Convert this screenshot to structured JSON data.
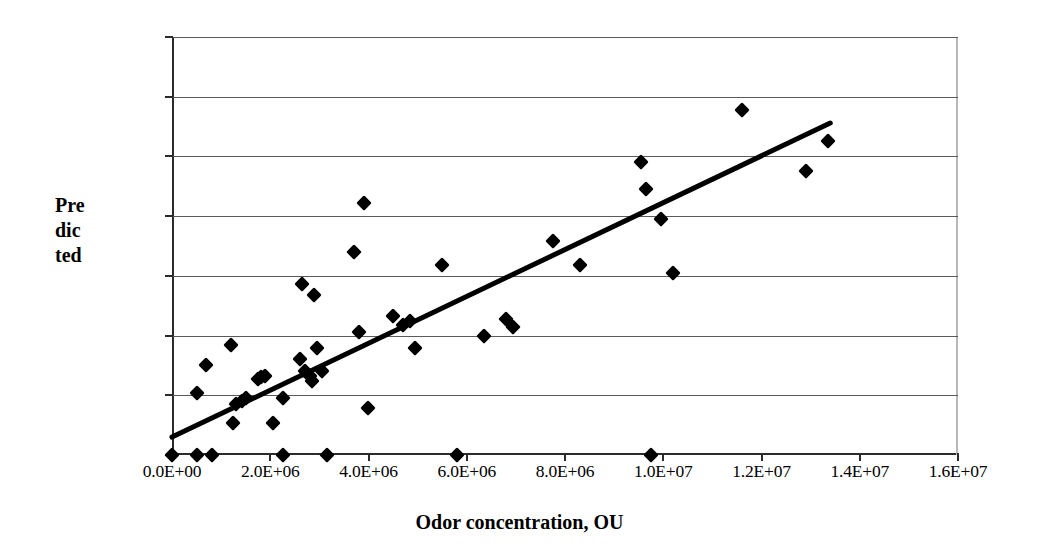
{
  "chart_data": {
    "type": "scatter",
    "title": "",
    "xlabel": "Odor concentration, OU",
    "ylabel": "Predicted",
    "ylabel_lines": [
      "Pre",
      "dic",
      "ted"
    ],
    "xlim": [
      0,
      16000000
    ],
    "ylim": [
      0,
      3500000
    ],
    "grid": true,
    "legend": false,
    "xticks": [
      0,
      2000000,
      4000000,
      6000000,
      8000000,
      10000000,
      12000000,
      14000000,
      16000000
    ],
    "xticklabels": [
      "0.0E+00",
      "2.0E+06",
      "4.0E+06",
      "6.0E+06",
      "8.0E+06",
      "1.0E+07",
      "1.2E+07",
      "1.4E+07",
      "1.6E+07"
    ],
    "yticks": [
      0,
      500000,
      1000000,
      1500000,
      2000000,
      2500000,
      3000000,
      3500000
    ],
    "yticklabels": [
      "0.0E+00",
      "5.0E+05",
      "1.0E+06",
      "1.5E+06",
      "2.0E+06",
      "2.5E+06",
      "3.0E+06",
      "3.5E+06"
    ],
    "series": [
      {
        "name": "Predicted vs Odor concentration",
        "marker": "diamond",
        "color": "#000000",
        "points": [
          [
            0,
            0
          ],
          [
            500000,
            0
          ],
          [
            820000,
            0
          ],
          [
            2250000,
            0
          ],
          [
            3150000,
            0
          ],
          [
            5800000,
            0
          ],
          [
            9750000,
            0
          ],
          [
            500000,
            520000
          ],
          [
            700000,
            750000
          ],
          [
            1200000,
            920000
          ],
          [
            1250000,
            270000
          ],
          [
            1300000,
            430000
          ],
          [
            1420000,
            450000
          ],
          [
            1500000,
            480000
          ],
          [
            1750000,
            640000
          ],
          [
            1820000,
            650000
          ],
          [
            1900000,
            660000
          ],
          [
            2050000,
            270000
          ],
          [
            2250000,
            480000
          ],
          [
            2600000,
            800000
          ],
          [
            2650000,
            1430000
          ],
          [
            2700000,
            700000
          ],
          [
            2800000,
            660000
          ],
          [
            2850000,
            620000
          ],
          [
            2900000,
            1340000
          ],
          [
            2950000,
            900000
          ],
          [
            3050000,
            700000
          ],
          [
            3700000,
            1700000
          ],
          [
            3800000,
            1030000
          ],
          [
            3900000,
            2110000
          ],
          [
            3980000,
            390000
          ],
          [
            4500000,
            1160000
          ],
          [
            4700000,
            1090000
          ],
          [
            4850000,
            1120000
          ],
          [
            4950000,
            900000
          ],
          [
            5500000,
            1590000
          ],
          [
            6350000,
            1000000
          ],
          [
            6800000,
            1140000
          ],
          [
            6950000,
            1070000
          ],
          [
            7750000,
            1790000
          ],
          [
            8300000,
            1590000
          ],
          [
            9550000,
            2450000
          ],
          [
            9650000,
            2230000
          ],
          [
            9950000,
            1980000
          ],
          [
            10200000,
            1520000
          ],
          [
            11600000,
            2890000
          ],
          [
            12900000,
            2380000
          ],
          [
            13350000,
            2630000
          ]
        ]
      }
    ],
    "trendline": {
      "type": "linear",
      "x_start": 0,
      "y_start": 150000,
      "x_end": 13400000,
      "y_end": 2780000
    }
  }
}
